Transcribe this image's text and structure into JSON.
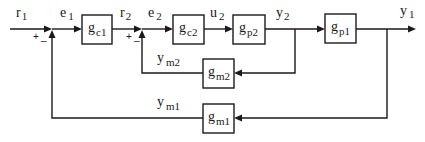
{
  "diagram": {
    "type": "cascade control block diagram",
    "colors": {
      "line": "#1a1a1a",
      "background": "#ffffff"
    },
    "signals": {
      "r1": {
        "base": "r",
        "sub": "1"
      },
      "e1": {
        "base": "e",
        "sub": "1"
      },
      "r2": {
        "base": "r",
        "sub": "2"
      },
      "e2": {
        "base": "e",
        "sub": "2"
      },
      "u2": {
        "base": "u",
        "sub": "2"
      },
      "y2": {
        "base": "y",
        "sub": "2"
      },
      "y1": {
        "base": "y",
        "sub": "1"
      },
      "ym2": {
        "base": "y",
        "sub": "m2"
      },
      "ym1": {
        "base": "y",
        "sub": "m1"
      }
    },
    "blocks": {
      "gc1": {
        "base": "g",
        "sub": "c1"
      },
      "gc2": {
        "base": "g",
        "sub": "c2"
      },
      "gp2": {
        "base": "g",
        "sub": "p2"
      },
      "gp1": {
        "base": "g",
        "sub": "p1"
      },
      "gm2": {
        "base": "g",
        "sub": "m2"
      },
      "gm1": {
        "base": "g",
        "sub": "m1"
      }
    },
    "junctions": {
      "outer": {
        "plus": "+",
        "minus": "_"
      },
      "inner": {
        "plus": "+",
        "minus": "_"
      }
    }
  }
}
